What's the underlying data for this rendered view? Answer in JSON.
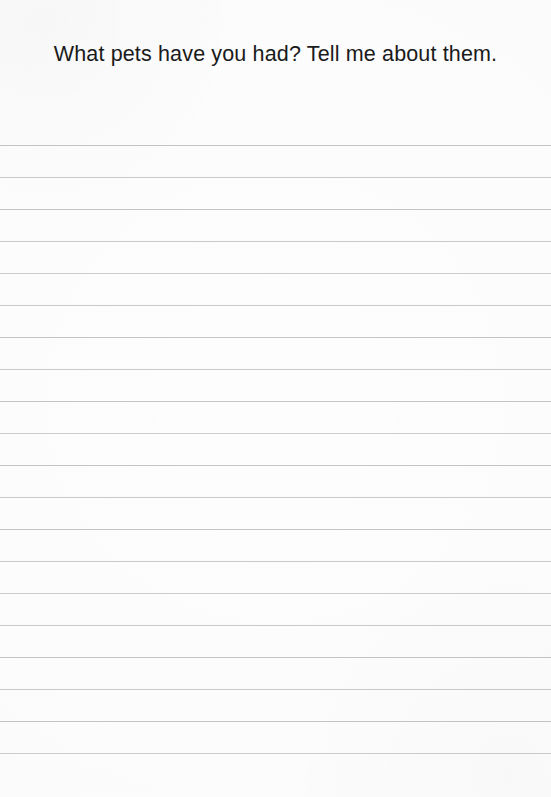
{
  "page": {
    "background_color": "#fdfdfd",
    "width": 551,
    "height": 797,
    "type": "lined-journal-page"
  },
  "heading": {
    "text": "What pets have you had? Tell me about them.",
    "color": "#1a1a1a",
    "align": "center",
    "lines": [
      "What pets have you had? Tell me about",
      "them."
    ]
  },
  "ruled_lines": {
    "count": 20,
    "color": "#c9c9cd",
    "thickness_px": 1,
    "spacing_px": 32,
    "first_line_y": 145,
    "last_line_y": 753,
    "full_bleed": true,
    "positions": [
      145,
      177,
      209,
      241,
      273,
      305,
      337,
      369,
      401,
      433,
      465,
      497,
      529,
      561,
      593,
      625,
      657,
      689,
      721,
      753
    ]
  },
  "writing_area": {
    "placeholder": "",
    "value": ""
  }
}
